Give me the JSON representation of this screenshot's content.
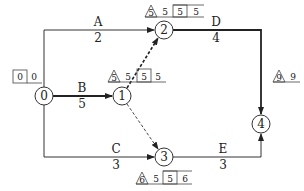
{
  "diagram": {
    "type": "activity-on-arrow network (CPM)",
    "nodes": [
      {
        "id": "0",
        "label": "0",
        "cx": 44,
        "cy": 96,
        "times": {
          "box": "0",
          "plain": "0"
        }
      },
      {
        "id": "1",
        "label": "1",
        "cx": 122,
        "cy": 96,
        "times": {
          "triangle": "5",
          "plain1": "5",
          "box": "5",
          "plain2": "5"
        }
      },
      {
        "id": "2",
        "label": "2",
        "cx": 164,
        "cy": 30,
        "times": {
          "triangle": "5",
          "plain1": "5",
          "box": "5",
          "plain2": "5"
        }
      },
      {
        "id": "3",
        "label": "3",
        "cx": 164,
        "cy": 157,
        "times": {
          "triangle": "6",
          "plain1": "5",
          "box": "5",
          "plain2": "6"
        }
      },
      {
        "id": "4",
        "label": "4",
        "cx": 261,
        "cy": 124,
        "times": {
          "triangle": "9",
          "plain": "9"
        }
      }
    ],
    "activities": [
      {
        "id": "A",
        "name": "A",
        "duration": "2",
        "from": "0",
        "to": "2",
        "style": "solid",
        "critical": false
      },
      {
        "id": "B",
        "name": "B",
        "duration": "5",
        "from": "0",
        "to": "1",
        "style": "solid",
        "critical": true
      },
      {
        "id": "C",
        "name": "C",
        "duration": "3",
        "from": "0",
        "to": "3",
        "style": "solid",
        "critical": false
      },
      {
        "id": "D",
        "name": "D",
        "duration": "4",
        "from": "2",
        "to": "4",
        "style": "solid",
        "critical": true
      },
      {
        "id": "E",
        "name": "E",
        "duration": "3",
        "from": "3",
        "to": "4",
        "style": "solid",
        "critical": false
      },
      {
        "id": "dummy12",
        "name": "",
        "duration": "",
        "from": "1",
        "to": "2",
        "style": "dashed-bold",
        "critical": true
      },
      {
        "id": "dummy13",
        "name": "",
        "duration": "",
        "from": "1",
        "to": "3",
        "style": "dashed",
        "critical": false
      }
    ],
    "colors": {
      "line": "#333333",
      "text": "#222222",
      "background": "#ffffff"
    }
  }
}
